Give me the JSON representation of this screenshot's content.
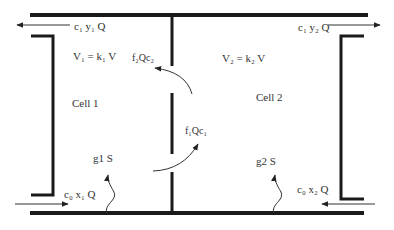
{
  "diagram": {
    "title": "",
    "cells": [
      {
        "name": "Cell 1",
        "volume": "V₁ = k₁ V",
        "source": "g1 S"
      },
      {
        "name": "Cell 2",
        "volume": "V₂ = k₂ V",
        "source": "g2 S"
      }
    ],
    "flows": {
      "outflow_left": "c₁ y₁ Q",
      "outflow_right": "c₁ y₂ Q",
      "inflow_left": "c₀  x₁ Q",
      "inflow_right": "c₀ x₂ Q",
      "exchange_2_to_1": "f₂Qc₂",
      "exchange_1_to_2": "f₁Qc₁"
    },
    "colors": {
      "wall": "#1a1a1a",
      "arrow": "#333333",
      "text": "#333333"
    }
  }
}
